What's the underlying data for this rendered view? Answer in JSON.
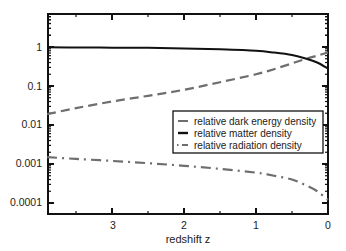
{
  "chart_data": {
    "type": "line",
    "title": "",
    "xlabel": "redshift z",
    "ylabel": "",
    "xscale": "linear",
    "yscale": "log",
    "xlim": [
      3.9,
      0
    ],
    "ylim": [
      5e-05,
      7
    ],
    "x_reversed": true,
    "grid": false,
    "legend_position": "center-right (inside plot, lower half)",
    "x_ticks": [
      3,
      2,
      1,
      0
    ],
    "x_tick_labels": [
      "3",
      "2",
      "1",
      "0"
    ],
    "y_ticks": [
      1,
      0.1,
      0.01,
      0.001,
      0.0001
    ],
    "y_tick_labels": [
      "1",
      "0.1",
      "0.01",
      "0.001",
      "0.0001"
    ],
    "x": [
      3.9,
      3.5,
      3.0,
      2.5,
      2.0,
      1.5,
      1.0,
      0.75,
      0.5,
      0.3,
      0.15,
      0.0
    ],
    "series": [
      {
        "name": "relative dark energy density",
        "style": "dashed",
        "color": "#6e6e6e",
        "values": [
          0.019,
          0.027,
          0.04,
          0.056,
          0.08,
          0.125,
          0.2,
          0.27,
          0.38,
          0.5,
          0.6,
          0.72
        ]
      },
      {
        "name": "relative matter density",
        "style": "solid",
        "color": "#111111",
        "values": [
          0.98,
          0.975,
          0.96,
          0.95,
          0.92,
          0.87,
          0.8,
          0.72,
          0.62,
          0.5,
          0.4,
          0.28
        ]
      },
      {
        "name": "relative radiation density",
        "style": "dash-dot",
        "color": "#6e6e6e",
        "values": [
          0.0015,
          0.00135,
          0.0012,
          0.00105,
          0.0009,
          0.00075,
          0.0006,
          0.0005,
          0.0004,
          0.00028,
          0.0002,
          0.00012
        ]
      }
    ]
  },
  "legend": {
    "items": [
      {
        "label": "relative dark energy density"
      },
      {
        "label": "relative matter density"
      },
      {
        "label": "relative radiation density"
      }
    ]
  },
  "axes": {
    "xlabel": "redshift z",
    "x_tick_labels": [
      "3",
      "2",
      "1",
      "0"
    ],
    "y_tick_labels": [
      "1",
      "0.1",
      "0.01",
      "0.001",
      "0.0001"
    ]
  }
}
